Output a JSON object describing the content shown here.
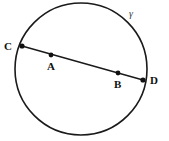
{
  "figure": {
    "type": "circle-with-chord-diagram",
    "background_color": "#ffffff",
    "stroke_color": "#1a1a1a",
    "dot_color": "#111111",
    "circle": {
      "name": "gamma",
      "label": "γ",
      "label_x": 129,
      "label_y": 9,
      "center_x": 81,
      "center_y": 69,
      "radius": 66,
      "stroke_width": 1.6
    },
    "chord": {
      "from": "C",
      "to": "D",
      "x1": 22,
      "y1": 46,
      "x2": 143,
      "y2": 80,
      "stroke_width": 1.5
    },
    "points": [
      {
        "label": "C",
        "x": 22,
        "y": 46,
        "on_circle": true,
        "label_x": 4,
        "label_y": 41,
        "dot_radius": 2.6
      },
      {
        "label": "A",
        "x": 51,
        "y": 55,
        "on_circle": false,
        "label_x": 47,
        "label_y": 61,
        "dot_radius": 2.4
      },
      {
        "label": "B",
        "x": 118,
        "y": 73,
        "on_circle": false,
        "label_x": 114,
        "label_y": 79,
        "dot_radius": 2.4
      },
      {
        "label": "D",
        "x": 143,
        "y": 80,
        "on_circle": true,
        "label_x": 150,
        "label_y": 75,
        "dot_radius": 2.6
      }
    ]
  }
}
